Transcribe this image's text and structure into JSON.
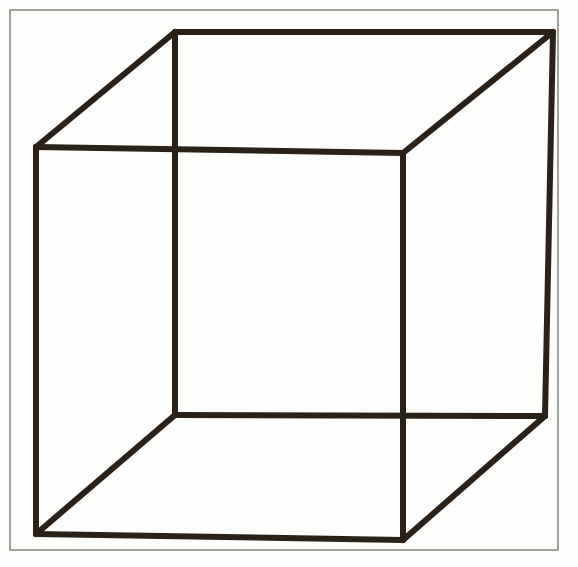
{
  "figure": {
    "name": "necker-cube",
    "caption": "",
    "canvas": {
      "width": 578,
      "height": 567
    },
    "colors": {
      "background": "#fdfdfb",
      "paper": "#ffffff",
      "ink": "#2a2219",
      "border": "#8d8d88"
    },
    "border_rect": {
      "x": 10,
      "y": 10,
      "width": 548,
      "height": 540,
      "stroke_width": 1.6
    },
    "line_width": 6,
    "vertices": {
      "back_top_left": {
        "x": 175,
        "y": 32
      },
      "back_top_right": {
        "x": 553,
        "y": 32
      },
      "back_bottom_right": {
        "x": 545,
        "y": 416
      },
      "back_bottom_left": {
        "x": 175,
        "y": 415
      },
      "front_top_left": {
        "x": 36,
        "y": 147
      },
      "front_top_right": {
        "x": 403,
        "y": 153
      },
      "front_bottom_right": {
        "x": 403,
        "y": 540
      },
      "front_bottom_left": {
        "x": 36,
        "y": 534
      }
    },
    "edges": [
      {
        "name": "back-top",
        "from": "back_top_left",
        "to": "back_top_right"
      },
      {
        "name": "back-right",
        "from": "back_top_right",
        "to": "back_bottom_right"
      },
      {
        "name": "back-bottom",
        "from": "back_bottom_right",
        "to": "back_bottom_left"
      },
      {
        "name": "back-left",
        "from": "back_bottom_left",
        "to": "back_top_left"
      },
      {
        "name": "front-top",
        "from": "front_top_left",
        "to": "front_top_right"
      },
      {
        "name": "front-right",
        "from": "front_top_right",
        "to": "front_bottom_right"
      },
      {
        "name": "front-bottom",
        "from": "front_bottom_right",
        "to": "front_bottom_left"
      },
      {
        "name": "front-left",
        "from": "front_bottom_left",
        "to": "front_top_left"
      },
      {
        "name": "connector-top-left",
        "from": "front_top_left",
        "to": "back_top_left"
      },
      {
        "name": "connector-top-right",
        "from": "front_top_right",
        "to": "back_top_right"
      },
      {
        "name": "connector-bottom-right",
        "from": "front_bottom_right",
        "to": "back_bottom_right"
      },
      {
        "name": "connector-bottom-left",
        "from": "front_bottom_left",
        "to": "back_bottom_left"
      }
    ]
  }
}
